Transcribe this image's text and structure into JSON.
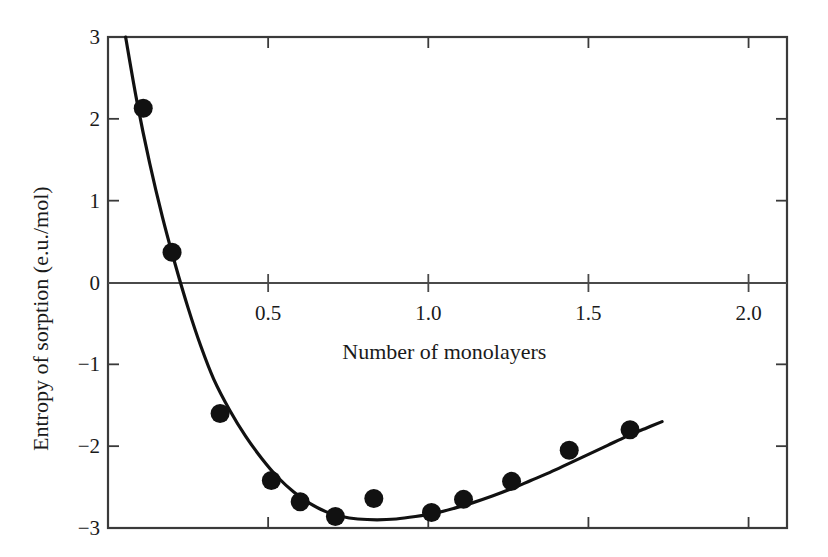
{
  "chart_data": {
    "type": "scatter",
    "title": "",
    "xlabel": "Number of monolayers",
    "ylabel": "Entropy of sorption (e.u./mol)",
    "xlim": [
      0.0,
      2.12
    ],
    "ylim": [
      -3,
      3
    ],
    "xticks": [
      0.5,
      1.0,
      1.5,
      2.0
    ],
    "xticklabels": [
      "0.5",
      "1.0",
      "1.5",
      "2.0"
    ],
    "yticks": [
      3,
      2,
      1,
      0,
      -1,
      -2,
      -3
    ],
    "yticklabels": [
      "3",
      "2",
      "1",
      "0",
      "−1",
      "−2",
      "−3"
    ],
    "grid": false,
    "legend": null,
    "zero_line": true,
    "marker": "filled-circle",
    "marker_color": "#111111",
    "line_color": "#111111",
    "series": [
      {
        "name": "Entropy of sorption",
        "x": [
          0.11,
          0.2,
          0.35,
          0.51,
          0.6,
          0.71,
          0.83,
          1.01,
          1.11,
          1.26,
          1.44,
          1.63
        ],
        "y": [
          2.13,
          0.37,
          -1.6,
          -2.42,
          -2.68,
          -2.86,
          -2.64,
          -2.81,
          -2.65,
          -2.43,
          -2.05,
          -1.8
        ]
      }
    ],
    "fit_curve": {
      "name": "fitted curve",
      "x": [
        0.055,
        0.09,
        0.13,
        0.17,
        0.21,
        0.25,
        0.29,
        0.33,
        0.38,
        0.43,
        0.48,
        0.53,
        0.58,
        0.63,
        0.68,
        0.73,
        0.78,
        0.84,
        0.9,
        0.96,
        1.02,
        1.08,
        1.14,
        1.2,
        1.26,
        1.32,
        1.38,
        1.44,
        1.5,
        1.56,
        1.62,
        1.68,
        1.73
      ],
      "y": [
        3.0,
        2.22,
        1.46,
        0.8,
        0.22,
        -0.31,
        -0.78,
        -1.18,
        -1.56,
        -1.88,
        -2.15,
        -2.38,
        -2.56,
        -2.7,
        -2.8,
        -2.86,
        -2.89,
        -2.9,
        -2.89,
        -2.86,
        -2.82,
        -2.76,
        -2.69,
        -2.61,
        -2.52,
        -2.42,
        -2.32,
        -2.21,
        -2.1,
        -1.99,
        -1.88,
        -1.78,
        -1.7
      ]
    }
  },
  "axes": {
    "frame": {
      "left": 108,
      "right": 787,
      "top": 37,
      "bottom": 528
    },
    "zero_line_y": 283
  }
}
